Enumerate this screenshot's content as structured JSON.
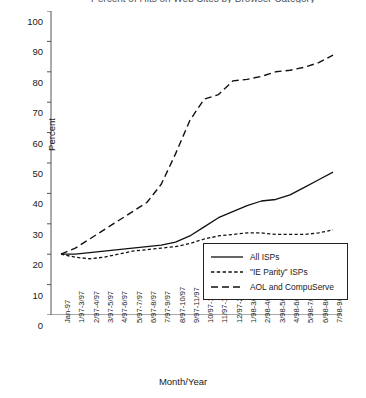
{
  "chart_data": {
    "type": "line",
    "title": "Percent of Hits on Web Sites by Browser Category",
    "xlabel": "Month/Year",
    "ylabel": "Percent",
    "ylim": [
      0,
      100
    ],
    "ytick_step": 10,
    "yticks": [
      "100",
      "90",
      "80",
      "70",
      "60",
      "50",
      "40",
      "30",
      "20",
      "10",
      "0"
    ],
    "grid": false,
    "legend_position": "bottom-right",
    "categories": [
      "Jan-97",
      "1/97-3/97",
      "2/97-4/97",
      "3/97-5/97",
      "4/97-6/97",
      "5/97-7/97",
      "6/97-8/97",
      "7/97-9/97",
      "8/97-10/97",
      "9/97-11/97",
      "10/97-12/97",
      "11/97-1/98",
      "12/97-2/98",
      "1/98-3/98",
      "2/98-4/98",
      "3/98-5/98",
      "4/98-6/98",
      "5/98-7/98",
      "6/98-8/98",
      "7/98-9/98"
    ],
    "series": [
      {
        "name": "All ISPs",
        "style": "solid",
        "values": [
          20,
          20,
          20.5,
          21,
          21.5,
          22,
          22.5,
          23,
          24,
          26,
          29,
          32,
          34,
          36,
          37.5,
          38,
          39.5,
          42,
          44.5,
          47
        ]
      },
      {
        "name": "\"IE Parity\" ISPs",
        "style": "dotted",
        "values": [
          20,
          19,
          18.5,
          19,
          20,
          21,
          21.5,
          22,
          22.5,
          23.5,
          25,
          26,
          26.5,
          27,
          27,
          26.5,
          26.5,
          26.5,
          27,
          28
        ]
      },
      {
        "name": "AOL and CompuServe",
        "style": "dashed",
        "values": [
          20,
          22,
          25,
          28,
          31,
          34,
          37,
          43,
          53,
          64,
          71,
          72.5,
          77,
          77.5,
          78.5,
          80,
          80.5,
          81.5,
          83,
          85.5
        ]
      }
    ]
  },
  "legend": {
    "items": [
      {
        "label": "All ISPs",
        "style": "solid"
      },
      {
        "label": "\"IE Parity\" ISPs",
        "style": "dotted"
      },
      {
        "label": "AOL and CompuServe",
        "style": "dashed"
      }
    ]
  }
}
